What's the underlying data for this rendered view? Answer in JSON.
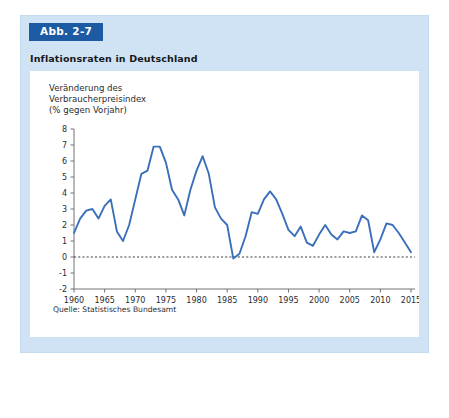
{
  "figure": {
    "badge_label": "Abb. 2-7",
    "subtitle": "Inflationsraten in Deutschland",
    "source_note": "Quelle: Statistisches Bundesamt",
    "axis_caption": "Veränderung des\nVerbraucherpreisindex\n(% gegen Vorjahr)"
  },
  "colors": {
    "badge_background": "#1c5ba3",
    "badge_text": "#ffffff",
    "panel_background": "#cfe3f4",
    "plot_background": "#ffffff",
    "series_line": "#3b6fbb",
    "axis": "#6f7276",
    "zero_line": "#3c3f42",
    "text": "#2a2c2f"
  },
  "chart_data": {
    "type": "line",
    "title": "Inflationsraten in Deutschland",
    "subtitle": "Veränderung des Verbraucherpreisindex (% gegen Vorjahr)",
    "xlabel": "",
    "ylabel": "Veränderung des Verbraucherpreisindex (% gegen Vorjahr)",
    "xlim": [
      1960,
      2015
    ],
    "ylim": [
      -2,
      8
    ],
    "xticks": [
      1960,
      1965,
      1970,
      1975,
      1980,
      1985,
      1990,
      1995,
      2000,
      2005,
      2010,
      2015
    ],
    "yticks": [
      -2,
      -1,
      0,
      1,
      2,
      3,
      4,
      5,
      6,
      7,
      8
    ],
    "xtick_labels": [
      "1960",
      "1965",
      "1970",
      "1975",
      "1980",
      "1985",
      "1990",
      "1995",
      "2000",
      "2005",
      "2010",
      "2015"
    ],
    "ytick_labels": [
      "-2",
      "-1",
      "0",
      "1",
      "2",
      "3",
      "4",
      "5",
      "6",
      "7",
      "8"
    ],
    "grid": false,
    "legend": false,
    "zero_reference_line": 0,
    "x": [
      1960,
      1961,
      1962,
      1963,
      1964,
      1965,
      1966,
      1967,
      1968,
      1969,
      1970,
      1971,
      1972,
      1973,
      1974,
      1975,
      1976,
      1977,
      1978,
      1979,
      1980,
      1981,
      1982,
      1983,
      1984,
      1985,
      1986,
      1987,
      1988,
      1989,
      1990,
      1991,
      1992,
      1993,
      1994,
      1995,
      1996,
      1997,
      1998,
      1999,
      2000,
      2001,
      2002,
      2003,
      2004,
      2005,
      2006,
      2007,
      2008,
      2009,
      2010,
      2011,
      2012,
      2013,
      2014,
      2015
    ],
    "series": [
      {
        "name": "Inflationsrate",
        "color": "#3b6fbb",
        "values": [
          1.5,
          2.4,
          2.9,
          3.0,
          2.4,
          3.2,
          3.6,
          1.6,
          1.0,
          2.0,
          3.6,
          5.2,
          5.4,
          6.9,
          6.9,
          5.9,
          4.2,
          3.6,
          2.6,
          4.2,
          5.4,
          6.3,
          5.2,
          3.1,
          2.4,
          2.0,
          -0.1,
          0.2,
          1.3,
          2.8,
          2.7,
          3.6,
          4.1,
          3.6,
          2.7,
          1.7,
          1.3,
          1.9,
          0.9,
          0.7,
          1.4,
          2.0,
          1.4,
          1.1,
          1.6,
          1.5,
          1.6,
          2.6,
          2.3,
          0.3,
          1.1,
          2.1,
          2.0,
          1.5,
          0.9,
          0.3
        ]
      }
    ]
  }
}
